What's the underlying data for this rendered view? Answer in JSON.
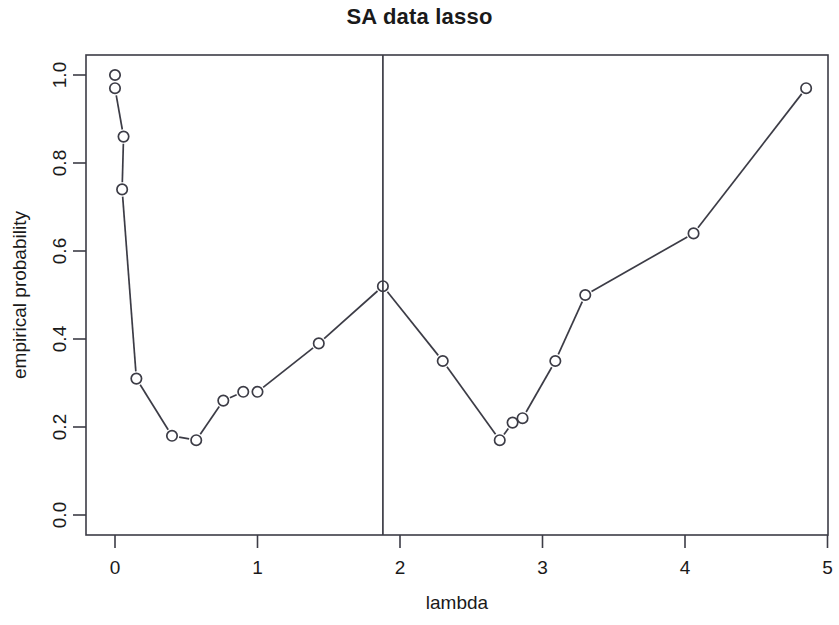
{
  "chart": {
    "title": "SA data lasso",
    "xlabel": "lambda",
    "ylabel": "empirical probability"
  },
  "chart_data": {
    "type": "line",
    "title": "SA data lasso",
    "subtitle": "",
    "xlabel": "lambda",
    "ylabel": "empirical probability",
    "xlim": [
      -0.2,
      5.0
    ],
    "ylim": [
      -0.04,
      1.04
    ],
    "grid": false,
    "legend": null,
    "marker": "open-circle",
    "line_color": "#3c3c46",
    "xticks": [
      0,
      1,
      2,
      3,
      4,
      5
    ],
    "xtick_labels": [
      "0",
      "1",
      "2",
      "3",
      "4",
      "5"
    ],
    "yticks": [
      0.0,
      0.2,
      0.4,
      0.6,
      0.8,
      1.0
    ],
    "ytick_labels": [
      "0.0",
      "0.2",
      "0.4",
      "0.6",
      "0.8",
      "1.0"
    ],
    "x": [
      0.0,
      0.0,
      0.06,
      0.05,
      0.15,
      0.4,
      0.57,
      0.76,
      0.9,
      1.0,
      1.43,
      1.88,
      2.3,
      2.7,
      2.79,
      2.86,
      3.09,
      3.3,
      4.06,
      4.85
    ],
    "y": [
      1.0,
      0.97,
      0.86,
      0.74,
      0.31,
      0.18,
      0.17,
      0.26,
      0.28,
      0.28,
      0.39,
      0.52,
      0.35,
      0.17,
      0.21,
      0.22,
      0.35,
      0.5,
      0.64,
      0.97
    ],
    "series": [
      {
        "name": "empirical probability",
        "x": [
          0.0,
          0.0,
          0.06,
          0.05,
          0.15,
          0.4,
          0.57,
          0.76,
          0.9,
          1.0,
          1.43,
          1.88,
          2.3,
          2.7,
          2.79,
          2.86,
          3.09,
          3.3,
          4.06,
          4.85
        ],
        "values": [
          1.0,
          0.97,
          0.86,
          0.74,
          0.31,
          0.18,
          0.17,
          0.26,
          0.28,
          0.28,
          0.39,
          0.52,
          0.35,
          0.17,
          0.21,
          0.22,
          0.35,
          0.5,
          0.64,
          0.97
        ]
      }
    ],
    "annotations": [
      {
        "type": "vline",
        "name": "selected-lambda-line",
        "x": 1.88,
        "label": ""
      }
    ]
  }
}
